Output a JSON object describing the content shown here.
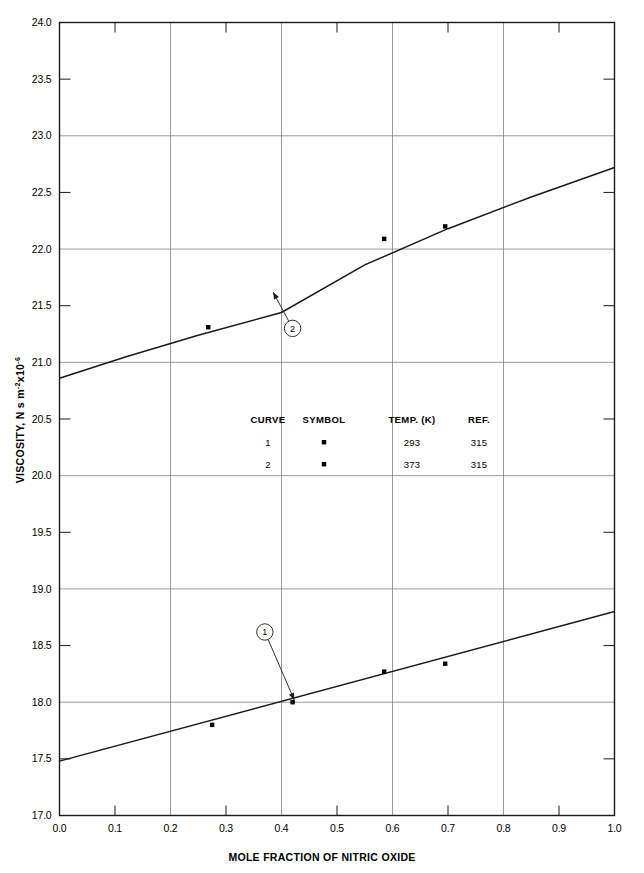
{
  "chart_data": {
    "type": "line",
    "title": "",
    "xlabel": "MOLE FRACTION OF NITRIC OXIDE",
    "ylabel": "VISCOSITY, N s m",
    "ylabel_sup1": "-2",
    "ylabel_mid": "x10",
    "ylabel_sup2": "-6",
    "xlim": [
      0.0,
      1.0
    ],
    "ylim": [
      17.0,
      24.0
    ],
    "xticks": [
      "0.0",
      "0.1",
      "0.2",
      "0.3",
      "0.4",
      "0.5",
      "0.6",
      "0.7",
      "0.8",
      "0.9",
      "1.0"
    ],
    "xtick_values": [
      0.0,
      0.1,
      0.2,
      0.3,
      0.4,
      0.5,
      0.6,
      0.7,
      0.8,
      0.9,
      1.0
    ],
    "yticks": [
      "17.0",
      "17.5",
      "18.0",
      "18.5",
      "19.0",
      "19.5",
      "20.0",
      "20.5",
      "21.0",
      "21.5",
      "22.0",
      "22.5",
      "23.0",
      "23.5",
      "24.0"
    ],
    "ytick_values": [
      17.0,
      17.5,
      18.0,
      18.5,
      19.0,
      19.5,
      20.0,
      20.5,
      21.0,
      21.5,
      22.0,
      22.5,
      23.0,
      23.5,
      24.0
    ],
    "grid": true,
    "grid_x_values": [
      0.2,
      0.4,
      0.6,
      0.8
    ],
    "grid_y_values": [
      18.0,
      19.0,
      20.0,
      21.0,
      22.0,
      23.0
    ],
    "legend_position": "inside-center",
    "series": [
      {
        "name": "1",
        "curve_label": "1",
        "temp_k": "293",
        "ref": "315",
        "symbol": "square",
        "line": [
          {
            "x": 0.0,
            "y": 17.48
          },
          {
            "x": 1.0,
            "y": 18.8
          }
        ],
        "points": [
          {
            "x": 0.275,
            "y": 17.8
          },
          {
            "x": 0.42,
            "y": 18.0
          },
          {
            "x": 0.585,
            "y": 18.27
          },
          {
            "x": 0.695,
            "y": 18.34
          }
        ],
        "callout": {
          "label": "1",
          "cx": 0.37,
          "cy": 18.62,
          "tip_x": 0.423,
          "tip_y": 18.02
        }
      },
      {
        "name": "2",
        "curve_label": "2",
        "temp_k": "373",
        "ref": "315",
        "symbol": "square",
        "line": [
          {
            "x": 0.0,
            "y": 20.86
          },
          {
            "x": 0.12,
            "y": 21.05
          },
          {
            "x": 0.25,
            "y": 21.24
          },
          {
            "x": 0.4,
            "y": 21.44
          },
          {
            "x": 0.55,
            "y": 21.86
          },
          {
            "x": 0.7,
            "y": 22.18
          },
          {
            "x": 0.85,
            "y": 22.46
          },
          {
            "x": 1.0,
            "y": 22.72
          }
        ],
        "points": [
          {
            "x": 0.268,
            "y": 21.31
          },
          {
            "x": 0.585,
            "y": 22.09
          },
          {
            "x": 0.695,
            "y": 22.2
          }
        ],
        "callout": {
          "label": "2",
          "cx": 0.42,
          "cy": 21.3,
          "tip_x": 0.385,
          "tip_y": 21.62
        }
      }
    ],
    "legend": {
      "headers": [
        "CURVE",
        "SYMBOL",
        "TEMP. (K)",
        "REF."
      ],
      "rows": [
        {
          "curve": "1",
          "symbol": "square",
          "temp": "293",
          "ref": "315"
        },
        {
          "curve": "2",
          "symbol": "square",
          "temp": "373",
          "ref": "315"
        }
      ]
    }
  },
  "colors": {
    "axis": "#1a1a1a",
    "grid": "#808080",
    "curve": "#1a1a1a",
    "marker": "#000000",
    "background": "#ffffff"
  }
}
